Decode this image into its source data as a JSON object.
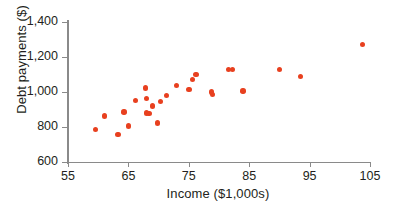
{
  "chart_data": {
    "type": "scatter",
    "title": "",
    "xlabel": "Income ($1,000s)",
    "ylabel": "Debt payments ($)",
    "xlim": [
      55,
      105
    ],
    "ylim": [
      600,
      1400
    ],
    "xticks": [
      55,
      65,
      75,
      85,
      95,
      105
    ],
    "xtick_labels": [
      "55",
      "65",
      "75",
      "85",
      "95",
      "105"
    ],
    "yticks": [
      600,
      800,
      1000,
      1200,
      1400
    ],
    "ytick_labels": [
      "600",
      "800",
      "1,000",
      "1,200",
      "1,400"
    ],
    "grid": false,
    "legend": null,
    "marker_color": "#e8401f",
    "axis_color": "#8a8a8a",
    "text_color": "#231f20",
    "points": [
      {
        "x": 59.6,
        "y": 786
      },
      {
        "x": 61.0,
        "y": 862
      },
      {
        "x": 63.3,
        "y": 758
      },
      {
        "x": 64.3,
        "y": 886
      },
      {
        "x": 65.0,
        "y": 806
      },
      {
        "x": 66.2,
        "y": 952
      },
      {
        "x": 67.8,
        "y": 1022
      },
      {
        "x": 68.0,
        "y": 964
      },
      {
        "x": 68.0,
        "y": 879
      },
      {
        "x": 68.4,
        "y": 876
      },
      {
        "x": 69.0,
        "y": 920
      },
      {
        "x": 69.8,
        "y": 824
      },
      {
        "x": 70.3,
        "y": 946
      },
      {
        "x": 71.3,
        "y": 980
      },
      {
        "x": 73.0,
        "y": 1038
      },
      {
        "x": 75.0,
        "y": 1014
      },
      {
        "x": 75.6,
        "y": 1070
      },
      {
        "x": 76.2,
        "y": 1100
      },
      {
        "x": 78.8,
        "y": 1000
      },
      {
        "x": 78.9,
        "y": 986
      },
      {
        "x": 81.6,
        "y": 1130
      },
      {
        "x": 82.2,
        "y": 1130
      },
      {
        "x": 84.0,
        "y": 1006
      },
      {
        "x": 90.0,
        "y": 1130
      },
      {
        "x": 93.5,
        "y": 1090
      },
      {
        "x": 103.8,
        "y": 1272
      }
    ]
  }
}
